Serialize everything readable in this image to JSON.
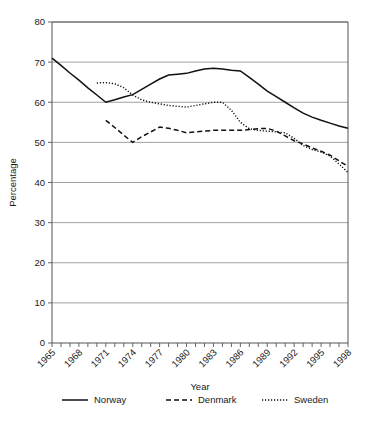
{
  "chart_data": {
    "type": "line",
    "title": "",
    "xlabel": "Year",
    "ylabel": "Percentage",
    "xlim": [
      1965,
      1998
    ],
    "ylim": [
      0,
      80
    ],
    "ytick_step": 10,
    "yticks": [
      0,
      10,
      20,
      30,
      40,
      50,
      60,
      70,
      80
    ],
    "xticks_labeled": [
      1965,
      1968,
      1971,
      1974,
      1977,
      1980,
      1983,
      1986,
      1989,
      1992,
      1995,
      1998
    ],
    "xtick_minor_every": 1,
    "grid": "horizontal",
    "legend_position": "bottom",
    "series": [
      {
        "name": "Norway",
        "style": "solid",
        "color": "#111111",
        "x": [
          1965,
          1966,
          1967,
          1968,
          1969,
          1970,
          1971,
          1972,
          1973,
          1974,
          1975,
          1976,
          1977,
          1978,
          1979,
          1980,
          1981,
          1982,
          1983,
          1984,
          1985,
          1986,
          1987,
          1988,
          1989,
          1990,
          1991,
          1992,
          1993,
          1994,
          1995,
          1996,
          1997,
          1998
        ],
        "y": [
          71.0,
          69.2,
          67.3,
          65.5,
          63.6,
          61.8,
          60.0,
          60.6,
          61.3,
          61.9,
          63.2,
          64.5,
          65.8,
          66.8,
          67.0,
          67.2,
          67.8,
          68.3,
          68.5,
          68.3,
          68.0,
          67.8,
          66.2,
          64.5,
          62.8,
          61.4,
          60.0,
          58.6,
          57.3,
          56.3,
          55.5,
          54.8,
          54.1,
          53.5
        ]
      },
      {
        "name": "Denmark",
        "style": "dashed",
        "color": "#111111",
        "x": [
          1971,
          1972,
          1973,
          1974,
          1975,
          1976,
          1977,
          1978,
          1979,
          1980,
          1981,
          1982,
          1983,
          1984,
          1985,
          1986,
          1987,
          1988,
          1989,
          1990,
          1991,
          1992,
          1993,
          1994,
          1995,
          1996,
          1997,
          1998
        ],
        "y": [
          55.5,
          53.7,
          51.8,
          50.0,
          51.4,
          52.6,
          53.8,
          53.5,
          53.0,
          52.4,
          52.6,
          52.8,
          53.0,
          53.0,
          53.0,
          53.0,
          53.2,
          53.4,
          53.5,
          52.8,
          51.6,
          50.4,
          49.6,
          48.6,
          47.8,
          46.8,
          45.4,
          44.0
        ]
      },
      {
        "name": "Sweden",
        "style": "dotted",
        "color": "#111111",
        "x": [
          1970,
          1971,
          1972,
          1973,
          1974,
          1975,
          1976,
          1977,
          1978,
          1979,
          1980,
          1981,
          1982,
          1983,
          1984,
          1985,
          1986,
          1987,
          1988,
          1989,
          1990,
          1991,
          1992,
          1993,
          1994,
          1995,
          1996,
          1997,
          1998
        ],
        "y": [
          64.8,
          64.9,
          64.6,
          63.6,
          61.8,
          60.6,
          60.0,
          59.6,
          59.2,
          59.0,
          58.8,
          59.2,
          59.6,
          60.0,
          60.0,
          58.0,
          55.0,
          53.4,
          53.0,
          52.8,
          52.6,
          52.4,
          51.0,
          49.2,
          48.2,
          47.6,
          46.6,
          44.6,
          42.5
        ]
      }
    ]
  },
  "legend": {
    "items": [
      {
        "label": "Norway",
        "style": "solid"
      },
      {
        "label": "Denmark",
        "style": "dashed"
      },
      {
        "label": "Sweden",
        "style": "dotted"
      }
    ]
  }
}
